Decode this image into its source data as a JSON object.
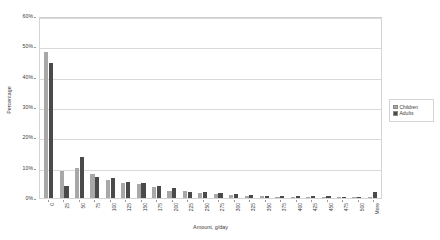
{
  "chart_data": {
    "type": "bar",
    "title": "",
    "xlabel": "Amount, g/day",
    "ylabel": "Percentage",
    "categories": [
      "0",
      "25",
      "50",
      "75",
      "100",
      "125",
      "150",
      "175",
      "200",
      "225",
      "250",
      "275",
      "300",
      "325",
      "350",
      "375",
      "400",
      "425",
      "450",
      "475",
      "500",
      "More"
    ],
    "series": [
      {
        "name": "Children",
        "color": "#a8a8a8",
        "values": [
          48.0,
          9.0,
          10.0,
          7.8,
          6.0,
          5.0,
          4.6,
          3.6,
          2.4,
          2.3,
          1.7,
          1.3,
          0.9,
          0.7,
          0.5,
          0.4,
          0.4,
          0.3,
          0.2,
          0.2,
          0.2,
          0.3
        ]
      },
      {
        "name": "Adults",
        "color": "#4a4a4a",
        "values": [
          44.5,
          4.0,
          13.5,
          7.0,
          6.5,
          5.2,
          4.8,
          3.8,
          3.3,
          2.0,
          1.9,
          1.5,
          1.2,
          1.0,
          0.8,
          0.7,
          0.6,
          0.5,
          0.5,
          0.4,
          0.4,
          2.0
        ]
      }
    ],
    "ylim": [
      0,
      60
    ],
    "yticks": [
      0,
      10,
      20,
      30,
      40,
      50,
      60
    ],
    "ytick_labels": [
      "0%",
      "10%",
      "20%",
      "30%",
      "40%",
      "50%",
      "60%"
    ],
    "grid": true,
    "legend_position": "right",
    "legend_entries": [
      "Children",
      "Adults"
    ]
  },
  "axes": {
    "y_title": "Percentage",
    "x_title": "Amount, g/day"
  },
  "colors": {
    "children": "#a8a8a8",
    "adults": "#4a4a4a",
    "gridline": "#d9d9d9",
    "plot_border": "#d4d4d4",
    "text": "#3a3a3a"
  }
}
